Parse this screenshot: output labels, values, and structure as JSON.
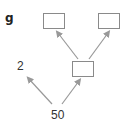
{
  "problem": {
    "label": "g"
  },
  "factor_tree": {
    "root": {
      "value": "50"
    },
    "level1": {
      "left": {
        "value": "2"
      },
      "right": {
        "value": "",
        "is_blank": true
      }
    },
    "level2": {
      "left": {
        "value": "",
        "is_blank": true
      },
      "right": {
        "value": "",
        "is_blank": true
      }
    }
  },
  "colors": {
    "arrow": "#999999",
    "box_border": "#8a8a8a",
    "text": "#333333"
  }
}
